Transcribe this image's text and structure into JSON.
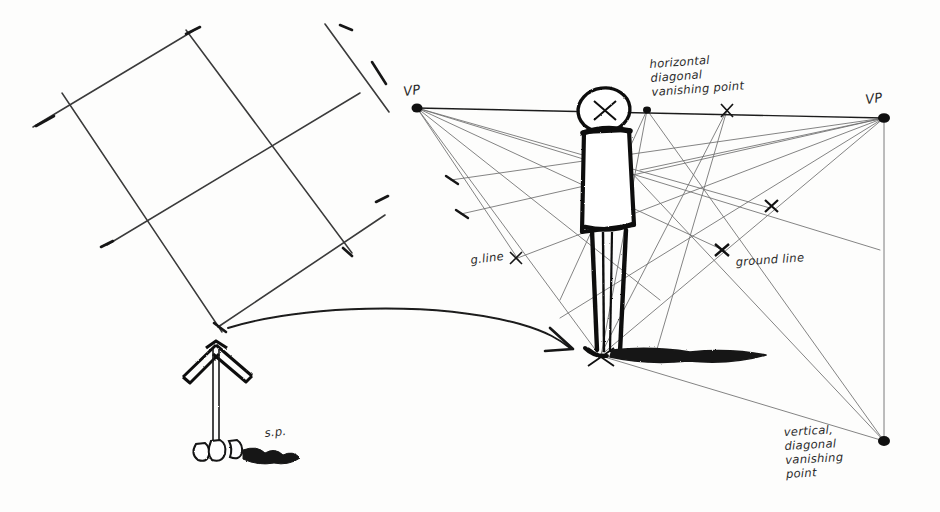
{
  "image": {
    "kind": "hand-drawn perspective construction sketch",
    "medium": "pen on white paper",
    "width": 940,
    "height": 512,
    "ink_color": "#1b1b1b",
    "light_ink_color": "#6f6f6f",
    "paper_color": "#fdfdfc"
  },
  "labels": {
    "vp_left": "VP",
    "vp_right": "VP",
    "horizontal_dvp": {
      "line1": "horizontal",
      "line2": "diagonal",
      "line3": "vanishing point"
    },
    "vertical_dvp": {
      "line1": "vertical,",
      "line2": "diagonal",
      "line3": "vanishing",
      "line4": "point"
    },
    "ground_line": "ground line",
    "g_line": "g.line",
    "station_point": "s.p."
  },
  "geometry": {
    "vp_left": {
      "x": 417,
      "y": 108
    },
    "vp_right": {
      "x": 884,
      "y": 118
    },
    "horizontal_dvp_x_mark": {
      "x": 727,
      "y": 110
    },
    "horizon_dot_mid": {
      "x": 647,
      "y": 110
    },
    "vertical_dvp": {
      "x": 884,
      "y": 441
    },
    "figure_base": {
      "x": 601,
      "y": 356
    },
    "figure_head_center": {
      "x": 604,
      "y": 110
    },
    "ground_line_mark": {
      "x": 722,
      "y": 250
    },
    "upper_cross_mark": {
      "x": 771,
      "y": 206
    },
    "g_line_mark": {
      "x": 516,
      "y": 258
    },
    "station_point": {
      "x": 215,
      "y": 452
    },
    "cone_apex": {
      "x": 216,
      "y": 344
    }
  },
  "parts": {
    "left_grid": "tilted two-by-two perspective grid of crossing straight lines with overhanging tick ends",
    "view_cone": "arrow / cone-of-vision symbol pointing up from the station point",
    "curved_arrow": "long curved arrow from the left grid to the standing figure's feet",
    "figure": "bold stick figure: circled head with an X, rectangular torso, two legs, heavy cast shadow",
    "horizon": "horizon line joining the two vanishing points",
    "convergence_lines": "light construction rays radiating from both vanishing points"
  }
}
